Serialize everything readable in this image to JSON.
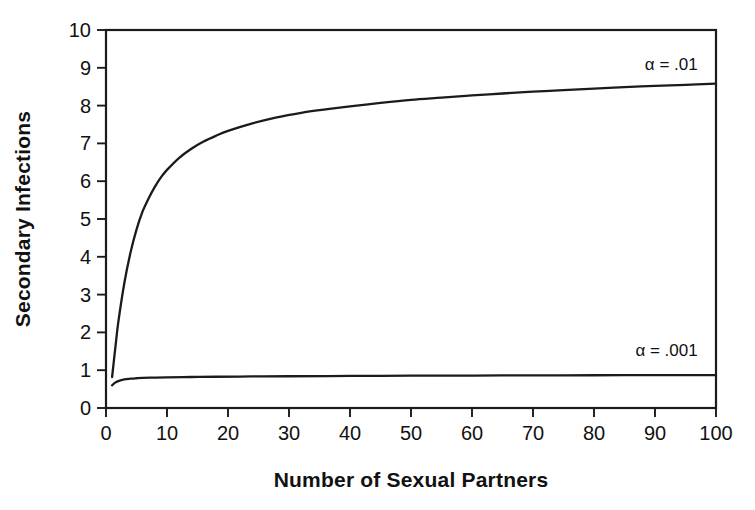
{
  "chart_data": {
    "type": "line",
    "title": "",
    "xlabel": "Number of Sexual Partners",
    "ylabel": "Secondary Infections",
    "xlim": [
      0,
      100
    ],
    "ylim": [
      0,
      10
    ],
    "xticks": [
      0,
      10,
      20,
      30,
      40,
      50,
      60,
      70,
      80,
      90,
      100
    ],
    "yticks": [
      0,
      1,
      2,
      3,
      4,
      5,
      6,
      7,
      8,
      9,
      10
    ],
    "xtick_labels": [
      "0",
      "10",
      "20",
      "30",
      "40",
      "50",
      "60",
      "70",
      "80",
      "90",
      "100"
    ],
    "ytick_labels": [
      "0",
      "1",
      "2",
      "3",
      "4",
      "5",
      "6",
      "7",
      "8",
      "9",
      "10"
    ],
    "grid": false,
    "legend_position": "inline-annotation",
    "frame": "full-box",
    "line_color": "#1b1b1b",
    "series": [
      {
        "name": "α = .01",
        "annotation": "α = .01",
        "annotation_x": 97,
        "annotation_y": 8.95,
        "x": [
          1,
          1.5,
          2,
          3,
          4,
          5,
          6,
          7,
          8,
          9,
          10,
          12,
          14,
          16,
          18,
          20,
          24,
          28,
          32,
          36,
          40,
          45,
          50,
          55,
          60,
          65,
          70,
          75,
          80,
          85,
          90,
          95,
          100
        ],
        "values": [
          0.82,
          1.55,
          2.25,
          3.3,
          4.1,
          4.72,
          5.2,
          5.55,
          5.85,
          6.1,
          6.3,
          6.62,
          6.86,
          7.05,
          7.2,
          7.33,
          7.53,
          7.69,
          7.81,
          7.9,
          7.98,
          8.07,
          8.15,
          8.21,
          8.27,
          8.32,
          8.37,
          8.41,
          8.45,
          8.49,
          8.52,
          8.55,
          8.58
        ]
      },
      {
        "name": "α = .001",
        "annotation": "α = .001",
        "annotation_x": 97,
        "annotation_y": 1.38,
        "x": [
          1,
          1.5,
          2,
          3,
          4,
          5,
          6,
          8,
          10,
          14,
          18,
          24,
          30,
          40,
          50,
          60,
          70,
          80,
          90,
          100
        ],
        "values": [
          0.6,
          0.67,
          0.71,
          0.755,
          0.775,
          0.787,
          0.795,
          0.805,
          0.812,
          0.82,
          0.827,
          0.834,
          0.84,
          0.848,
          0.854,
          0.859,
          0.863,
          0.866,
          0.869,
          0.872
        ]
      }
    ]
  },
  "plot_geometry": {
    "left": 106,
    "right": 716,
    "top": 30,
    "bottom": 408
  }
}
